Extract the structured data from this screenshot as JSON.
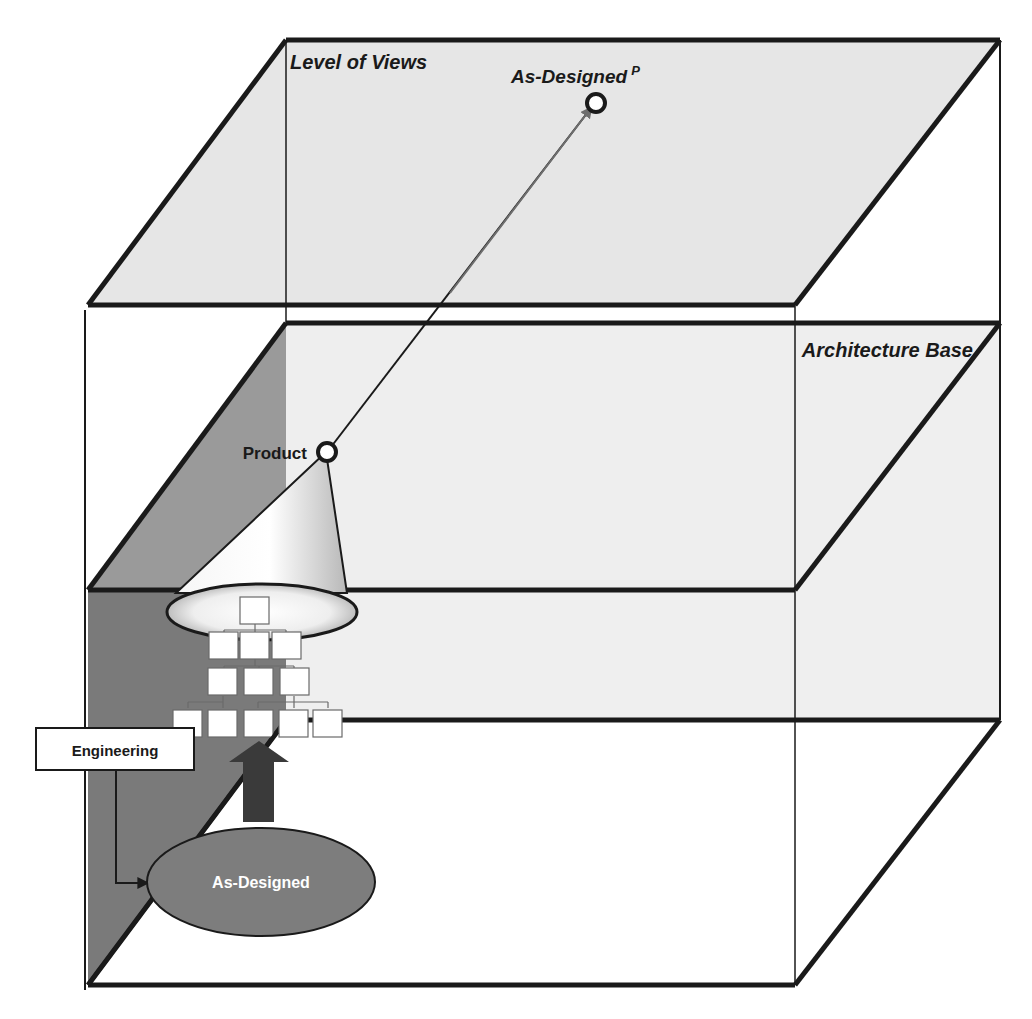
{
  "diagram": {
    "layers": {
      "top": {
        "label": "Level of Views"
      },
      "middle": {
        "label": "Architecture Base"
      },
      "bottom": {
        "label": ""
      }
    },
    "nodes": {
      "as_designed_p": {
        "label": "As-Designed",
        "superscript": "P"
      },
      "product": {
        "label": "Product"
      },
      "engineering": {
        "label": "Engineering"
      },
      "as_designed": {
        "label": "As-Designed"
      }
    },
    "tree": {
      "rows": [
        1,
        3,
        3,
        5
      ]
    },
    "colors": {
      "plane_fill": "#e6e6e6",
      "plane_fill_light": "#efefef",
      "left_wall": "#7a7a7a",
      "left_wall_upper": "#9a9a9a",
      "ellipse_fill": "#7d7d7d",
      "arrow_fill": "#3a3a3a",
      "line": "#1a1a1a",
      "link_arrow": "#6e6e6e"
    }
  }
}
